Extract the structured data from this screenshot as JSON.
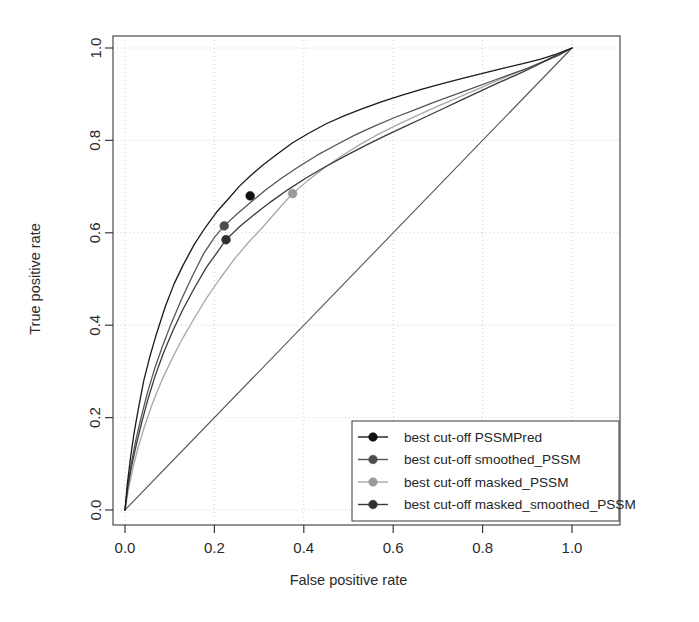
{
  "chart_data": {
    "type": "line",
    "title": "",
    "xlabel": "False positive rate",
    "ylabel": "True positive rate",
    "xlim": [
      0.0,
      1.0
    ],
    "ylim": [
      0.0,
      1.0
    ],
    "xticks": [
      "0.0",
      "0.2",
      "0.4",
      "0.6",
      "0.8",
      "1.0"
    ],
    "yticks": [
      "0.0",
      "0.2",
      "0.4",
      "0.6",
      "0.8",
      "1.0"
    ],
    "xtick_values": [
      0.0,
      0.2,
      0.4,
      0.6,
      0.8,
      1.0
    ],
    "ytick_values": [
      0.0,
      0.2,
      0.4,
      0.6,
      0.8,
      1.0
    ],
    "grid": true,
    "grid_style": "dotted",
    "legend_position": "bottom-right",
    "reference_line": {
      "name": "diagonal",
      "x": [
        0.0,
        1.0
      ],
      "y": [
        0.0,
        1.0
      ],
      "color": "#555555"
    },
    "series": [
      {
        "name": "PSSMPred",
        "legend_label": "best cut-off PSSMPred",
        "color": "#1a1a1a",
        "marker": {
          "x": 0.28,
          "y": 0.68,
          "color": "#111111"
        },
        "x": [
          0.0,
          0.005,
          0.012,
          0.02,
          0.03,
          0.042,
          0.055,
          0.07,
          0.09,
          0.11,
          0.13,
          0.155,
          0.18,
          0.205,
          0.23,
          0.255,
          0.28,
          0.31,
          0.34,
          0.375,
          0.41,
          0.45,
          0.49,
          0.53,
          0.575,
          0.62,
          0.665,
          0.71,
          0.755,
          0.8,
          0.845,
          0.89,
          0.93,
          0.965,
          1.0
        ],
        "y": [
          0.0,
          0.055,
          0.11,
          0.165,
          0.22,
          0.28,
          0.33,
          0.38,
          0.44,
          0.49,
          0.53,
          0.575,
          0.612,
          0.645,
          0.672,
          0.7,
          0.723,
          0.748,
          0.77,
          0.795,
          0.815,
          0.836,
          0.853,
          0.868,
          0.884,
          0.898,
          0.911,
          0.923,
          0.934,
          0.945,
          0.956,
          0.966,
          0.976,
          0.987,
          1.0
        ]
      },
      {
        "name": "smoothed_PSSM",
        "legend_label": "best cut-off smoothed_PSSM",
        "color": "#555555",
        "marker": {
          "x": 0.222,
          "y": 0.615,
          "color": "#4d4d4d"
        },
        "x": [
          0.0,
          0.006,
          0.014,
          0.024,
          0.036,
          0.05,
          0.066,
          0.084,
          0.104,
          0.126,
          0.15,
          0.176,
          0.2,
          0.222,
          0.25,
          0.28,
          0.315,
          0.35,
          0.39,
          0.43,
          0.472,
          0.515,
          0.558,
          0.602,
          0.648,
          0.692,
          0.735,
          0.778,
          0.82,
          0.862,
          0.9,
          0.938,
          0.97,
          1.0
        ],
        "y": [
          0.0,
          0.05,
          0.1,
          0.15,
          0.2,
          0.253,
          0.305,
          0.355,
          0.405,
          0.455,
          0.505,
          0.555,
          0.59,
          0.615,
          0.64,
          0.665,
          0.693,
          0.718,
          0.744,
          0.768,
          0.79,
          0.812,
          0.831,
          0.849,
          0.866,
          0.883,
          0.898,
          0.913,
          0.928,
          0.943,
          0.956,
          0.971,
          0.984,
          1.0
        ]
      },
      {
        "name": "masked_PSSM",
        "legend_label": "best cut-off masked_PSSM",
        "color": "#a8a8a8",
        "marker": {
          "x": 0.375,
          "y": 0.685,
          "color": "#9a9a9a"
        },
        "x": [
          0.0,
          0.008,
          0.018,
          0.03,
          0.045,
          0.062,
          0.082,
          0.104,
          0.128,
          0.155,
          0.182,
          0.212,
          0.242,
          0.275,
          0.308,
          0.342,
          0.375,
          0.41,
          0.448,
          0.487,
          0.527,
          0.568,
          0.61,
          0.652,
          0.695,
          0.738,
          0.78,
          0.822,
          0.862,
          0.9,
          0.938,
          0.97,
          1.0
        ],
        "y": [
          0.0,
          0.046,
          0.092,
          0.138,
          0.185,
          0.232,
          0.28,
          0.325,
          0.37,
          0.415,
          0.458,
          0.5,
          0.54,
          0.578,
          0.612,
          0.65,
          0.685,
          0.714,
          0.742,
          0.768,
          0.792,
          0.814,
          0.834,
          0.853,
          0.872,
          0.89,
          0.907,
          0.925,
          0.941,
          0.956,
          0.972,
          0.986,
          1.0
        ]
      },
      {
        "name": "masked_smoothed_PSSM",
        "legend_label": "best cut-off masked_smoothed_PSSM",
        "color": "#3a3a3a",
        "marker": {
          "x": 0.226,
          "y": 0.585,
          "color": "#303030"
        },
        "x": [
          0.0,
          0.006,
          0.015,
          0.026,
          0.038,
          0.052,
          0.068,
          0.086,
          0.107,
          0.13,
          0.155,
          0.182,
          0.205,
          0.226,
          0.256,
          0.29,
          0.326,
          0.364,
          0.404,
          0.446,
          0.49,
          0.534,
          0.578,
          0.622,
          0.666,
          0.71,
          0.752,
          0.794,
          0.836,
          0.876,
          0.916,
          0.952,
          1.0
        ],
        "y": [
          0.0,
          0.048,
          0.096,
          0.144,
          0.192,
          0.242,
          0.292,
          0.34,
          0.388,
          0.435,
          0.48,
          0.525,
          0.556,
          0.585,
          0.613,
          0.64,
          0.667,
          0.693,
          0.718,
          0.742,
          0.765,
          0.787,
          0.808,
          0.828,
          0.848,
          0.868,
          0.887,
          0.906,
          0.925,
          0.942,
          0.96,
          0.978,
          1.0
        ]
      }
    ]
  },
  "axes": {
    "x_title": "False positive rate",
    "y_title": "True positive rate"
  },
  "legend": {
    "items": [
      "best cut-off PSSMPred",
      "best cut-off smoothed_PSSM",
      "best cut-off masked_PSSM",
      "best cut-off masked_smoothed_PSSM"
    ]
  }
}
